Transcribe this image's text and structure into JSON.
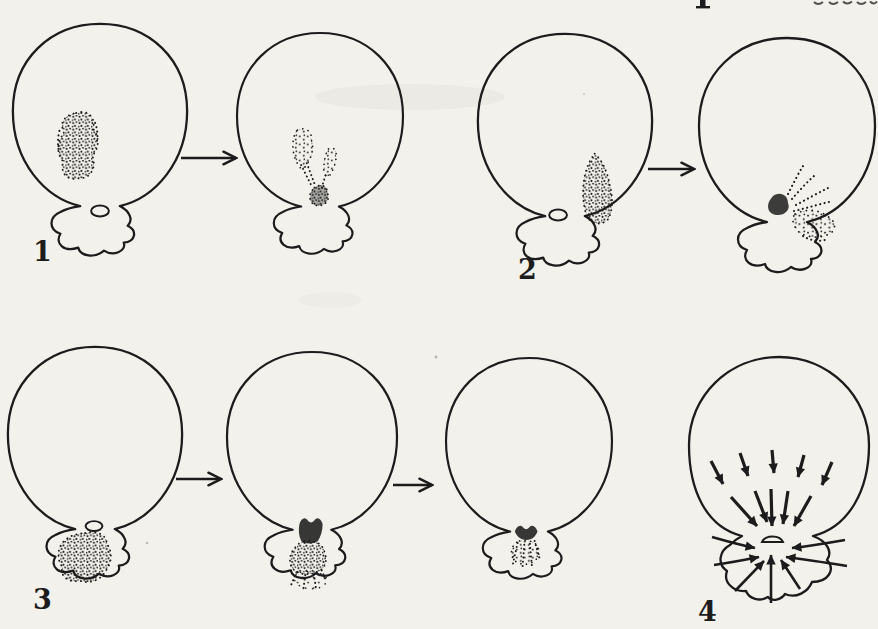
{
  "canvas": {
    "paper_color": "#f2f1ec",
    "ink_color": "#1c1c1c"
  },
  "figures": [
    {
      "label": "1"
    },
    {
      "label": "2"
    },
    {
      "label": "3"
    },
    {
      "label": "4"
    }
  ]
}
